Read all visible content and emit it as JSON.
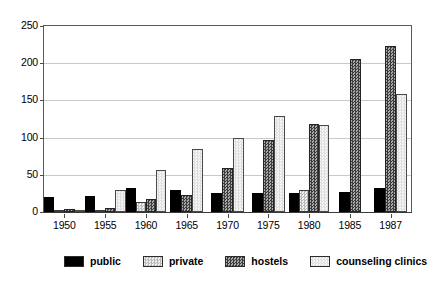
{
  "chart_data": {
    "type": "bar",
    "title": "",
    "subtitle": "",
    "xlabel": "",
    "ylabel": "",
    "ylim": [
      0,
      250
    ],
    "yticks": [
      0,
      50,
      100,
      150,
      200,
      250
    ],
    "ytick_labels": [
      "0",
      "50",
      "100",
      "150",
      "200",
      "250"
    ],
    "grid": true,
    "grid_axis": "y",
    "legend_position": "below",
    "categories": [
      "1950",
      "1955",
      "1960",
      "1965",
      "1970",
      "1975",
      "1980",
      "1985",
      "1987"
    ],
    "series": [
      {
        "name": "public",
        "color": "#000000",
        "pattern": "solid",
        "values": [
          20,
          21,
          32,
          29,
          25,
          25,
          26,
          27,
          32
        ]
      },
      {
        "name": "private",
        "color": "#e8e8e8",
        "pattern": "light-checker",
        "values": [
          1,
          1,
          14,
          null,
          null,
          null,
          30,
          null,
          null
        ]
      },
      {
        "name": "hostels",
        "color": "#7b7b7b",
        "pattern": "dark-checker",
        "values": [
          4,
          5,
          17,
          23,
          59,
          97,
          118,
          205,
          223
        ]
      },
      {
        "name": "counseling clinics",
        "color": "#eaeaea",
        "pattern": "pale-checker",
        "values": [
          2,
          29,
          57,
          85,
          99,
          129,
          117,
          null,
          158
        ]
      }
    ]
  },
  "legend": {
    "items": [
      {
        "label": "public"
      },
      {
        "label": "private"
      },
      {
        "label": "hostels"
      },
      {
        "label": "counseling clinics"
      }
    ]
  }
}
